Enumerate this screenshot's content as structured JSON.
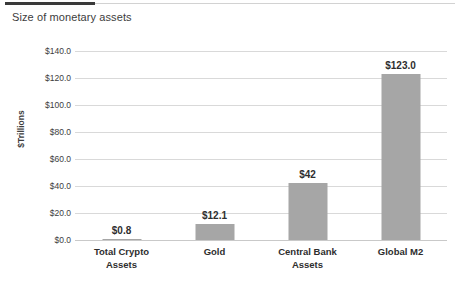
{
  "chart_data": {
    "type": "bar",
    "title": "Size of monetary assets",
    "xlabel": "",
    "ylabel": "$Trillions",
    "categories": [
      "Total Crypto Assets",
      "Gold",
      "Central Bank Assets",
      "Global M2"
    ],
    "values": [
      0.8,
      12.1,
      42,
      123.0
    ],
    "data_labels": [
      "$0.8",
      "$12.1",
      "$42",
      "$123.0"
    ],
    "ylim": [
      0,
      140
    ],
    "ytick_values": [
      0,
      20,
      40,
      60,
      80,
      100,
      120,
      140
    ],
    "ytick_labels": [
      "$0.0",
      "$20.0",
      "$40.0",
      "$60.0",
      "$80.0",
      "$100.0",
      "$120.0",
      "$140.0"
    ],
    "grid": true,
    "legend": false,
    "bar_color": "#a6a6a6",
    "gridline_color": "#d9d9d9"
  },
  "category_lines": [
    [
      "Total Crypto",
      "Assets"
    ],
    [
      "Gold"
    ],
    [
      "Central Bank",
      "Assets"
    ],
    [
      "Global M2"
    ]
  ]
}
